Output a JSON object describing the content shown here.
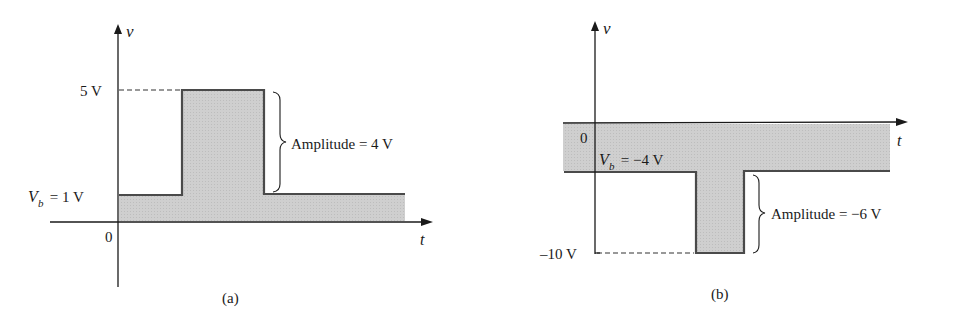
{
  "figure": {
    "panel_a": {
      "caption": "(a)",
      "y_axis_label": "v",
      "x_axis_label": "t",
      "origin_label": "0",
      "peak_label": "5 V",
      "baseline_label_sym": "V",
      "baseline_label_sub": "b",
      "baseline_label_rest": " = 1 V",
      "amplitude_label": "Amplitude = 4 V",
      "baseline_value": 1,
      "peak_value": 5,
      "amplitude_value": 4
    },
    "panel_b": {
      "caption": "(b)",
      "y_axis_label": "v",
      "x_axis_label": "t",
      "origin_label": "0",
      "peak_label": "–10 V",
      "baseline_label_sym": "V",
      "baseline_label_sub": "b",
      "baseline_label_rest": " = −4 V",
      "amplitude_label": "Amplitude = −6 V",
      "baseline_value": -4,
      "peak_value": -10,
      "amplitude_value": -6
    },
    "colors": {
      "fill": "#c9c9c9",
      "stroke": "#4a4a4a",
      "axis": "#1a1a1a"
    }
  }
}
